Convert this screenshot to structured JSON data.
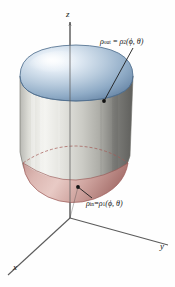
{
  "figure": {
    "background_color": "#fefefe"
  },
  "axes": {
    "origin": {
      "x": 70,
      "y": 218
    },
    "z": {
      "label": "z",
      "label_x": 67,
      "label_y": 14,
      "tip_x": 70,
      "tip_y": 22
    },
    "y": {
      "label": "y",
      "label_x": 160,
      "label_y": 248,
      "tip_x": 168,
      "tip_y": 245
    },
    "x": {
      "label": "x",
      "label_x": 14,
      "label_y": 268,
      "tip_x": 8,
      "tip_y": 275
    },
    "color": "#4a4a4a"
  },
  "solid": {
    "outer_surface": {
      "name": "outer-spherical-cap",
      "color_light": "#e9f0f7",
      "color_mid": "#9fb8d0",
      "color_dark": "#6b88a8",
      "outline": "#4e6c8c"
    },
    "lateral_surface": {
      "name": "lateral-wall",
      "color_light": "#f2f2f0",
      "color_mid": "#cfcfc9",
      "color_dark": "#6e6e6c",
      "outline": "#7a7a76"
    },
    "inner_surface": {
      "name": "inner-spherical-cap",
      "color_light": "#e2c3bf",
      "color_mid": "#c39a96",
      "color_dark": "#a8736f",
      "outline": "#9e5f5c"
    },
    "hidden_edge": {
      "name": "hidden-rim-dashed",
      "color": "#a35a57",
      "dash": "3 2"
    }
  },
  "annotations": {
    "outer": {
      "rho_symbol": "ρ",
      "sub_out": "out",
      "equals": " = ",
      "rho2_symbol": "ρ",
      "sub_2": "2",
      "args": "(ϕ, θ)",
      "full_text": "ρout = ρ2(ϕ, θ)",
      "label_x": 101,
      "label_y": 38,
      "point_x": 104,
      "point_y": 101
    },
    "inner": {
      "rho_symbol": "ρ",
      "sub_in": "in",
      "equals": "=",
      "rho1_symbol": "ρ",
      "sub_1": "1",
      "args": "(ϕ, θ)",
      "full_text": "ρin = ρ1(ϕ, θ)",
      "label_x": 88,
      "label_y": 200,
      "point_x": 78,
      "point_y": 187
    },
    "leader_color": "#1c1c1c",
    "dot_color": "#111111"
  }
}
